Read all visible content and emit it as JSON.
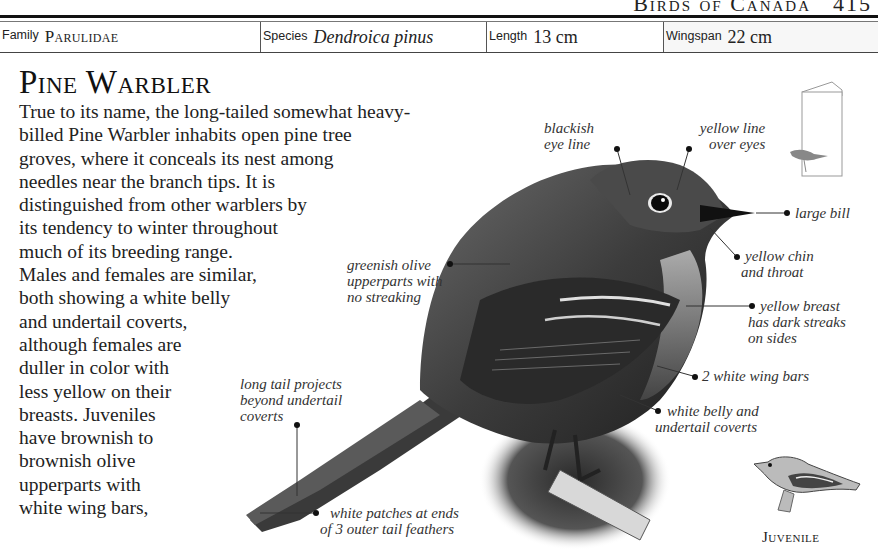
{
  "running_head": {
    "title": "Birds of Canada",
    "page_number": "415"
  },
  "info_row": {
    "family": {
      "label": "Family",
      "value": "Parulidae"
    },
    "species": {
      "label": "Species",
      "value": "Dendroica pinus"
    },
    "length": {
      "label": "Length",
      "value": "13 cm"
    },
    "wingspan": {
      "label": "Wingspan",
      "value": "22 cm"
    }
  },
  "title": "Pine Warbler",
  "body_lines": [
    "True to its name, the long-tailed somewhat heavy-",
    "billed Pine Warbler inhabits open pine tree",
    "groves, where it conceals its nest among",
    "needles near the branch tips. It is",
    "distinguished from other warblers by",
    "its tendency to winter throughout",
    "much of its breeding range.",
    "Males and females are similar,",
    "both showing a white belly",
    "and undertail coverts,",
    "although females are",
    "duller in color with",
    "less yellow on their",
    "breasts. Juveniles",
    "have brownish to",
    "brownish olive",
    "upperparts with",
    "white wing bars,"
  ],
  "callouts": {
    "eye_line": [
      "blackish",
      "eye line"
    ],
    "yellow_line": [
      "yellow line",
      "over eyes"
    ],
    "large_bill": [
      "large bill"
    ],
    "chin": [
      "yellow chin",
      "and throat"
    ],
    "upperparts": [
      "greenish olive",
      "upperparts with",
      "no streaking"
    ],
    "breast": [
      "yellow breast",
      "has dark streaks",
      "on sides"
    ],
    "wing_bars": [
      "2 white wing bars"
    ],
    "tail": [
      "long tail projects",
      "beyond undertail",
      "coverts"
    ],
    "belly": [
      "white belly and",
      "undertail coverts"
    ],
    "tail_patches": [
      "white patches at ends",
      "of 3 outer tail feathers"
    ]
  },
  "juvenile_caption": "Juvenile",
  "icons": {
    "habitat": "feeder-house-icon",
    "main_bird": "pine-warbler-illustration",
    "juvenile_bird": "juvenile-warbler-illustration"
  }
}
